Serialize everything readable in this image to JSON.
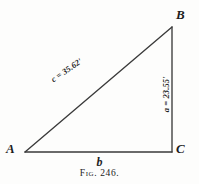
{
  "figure": {
    "caption": "Fig. 246.",
    "shape": "right-triangle",
    "stroke_color": "#3a3a3a",
    "background_color": "#fdfdfc",
    "vertices": {
      "A": {
        "label": "A",
        "x": 25,
        "y": 152
      },
      "B": {
        "label": "B",
        "x": 172,
        "y": 27
      },
      "C": {
        "label": "C",
        "x": 172,
        "y": 152
      }
    },
    "sides": {
      "hypotenuse": {
        "label": "c = 35.62'",
        "from": "A",
        "to": "B"
      },
      "vertical": {
        "label": "a = 23.55'",
        "from": "B",
        "to": "C"
      },
      "base": {
        "label": "b",
        "from": "A",
        "to": "C"
      }
    }
  }
}
